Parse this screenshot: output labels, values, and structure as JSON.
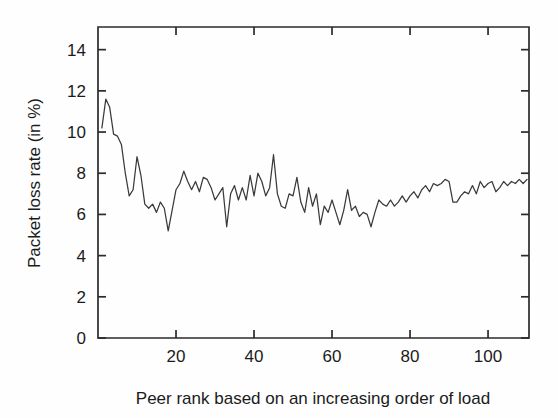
{
  "chart_data": {
    "type": "line",
    "title": "",
    "subtitle": "",
    "xlabel": "Peer rank based on an increasing order of load",
    "ylabel": "Packet loss rate (in %)",
    "xlim": [
      0,
      110.5
    ],
    "ylim": [
      0,
      15.1
    ],
    "xticks": [
      20,
      40,
      60,
      80,
      100
    ],
    "xtick_labels": [
      "20",
      "40",
      "60",
      "80",
      "100"
    ],
    "yticks": [
      0,
      2,
      4,
      6,
      8,
      10,
      12,
      14
    ],
    "ytick_labels": [
      "0",
      "2",
      "4",
      "6",
      "8",
      "10",
      "12",
      "14"
    ],
    "grid": false,
    "legend": null,
    "legend_position": "none",
    "line_color": "#3a3a3a",
    "frame_color": "#2b2b2b",
    "background_color": "#fefefe",
    "series": [
      {
        "name": "Packet loss rate",
        "x": [
          1,
          2,
          3,
          4,
          5,
          6,
          7,
          8,
          9,
          10,
          11,
          12,
          13,
          14,
          15,
          16,
          17,
          18,
          19,
          20,
          21,
          22,
          23,
          24,
          25,
          26,
          27,
          28,
          29,
          30,
          31,
          32,
          33,
          34,
          35,
          36,
          37,
          38,
          39,
          40,
          41,
          42,
          43,
          44,
          45,
          46,
          47,
          48,
          49,
          50,
          51,
          52,
          53,
          54,
          55,
          56,
          57,
          58,
          59,
          60,
          61,
          62,
          63,
          64,
          65,
          66,
          67,
          68,
          69,
          70,
          71,
          72,
          73,
          74,
          75,
          76,
          77,
          78,
          79,
          80,
          81,
          82,
          83,
          84,
          85,
          86,
          87,
          88,
          89,
          90,
          91,
          92,
          93,
          94,
          95,
          96,
          97,
          98,
          99,
          100,
          101,
          102,
          103,
          104,
          105,
          106,
          107,
          108,
          109,
          110
        ],
        "values": [
          10.2,
          11.6,
          11.2,
          9.9,
          9.8,
          9.4,
          8.0,
          6.9,
          7.2,
          8.8,
          7.9,
          6.5,
          6.3,
          6.5,
          6.1,
          6.6,
          6.3,
          5.2,
          6.2,
          7.2,
          7.5,
          8.1,
          7.6,
          7.2,
          7.6,
          7.1,
          7.8,
          7.7,
          7.3,
          6.7,
          7.0,
          7.3,
          5.4,
          7.0,
          7.4,
          6.7,
          7.3,
          6.7,
          7.9,
          6.9,
          8.0,
          7.6,
          6.9,
          7.3,
          8.9,
          7.0,
          6.4,
          6.3,
          7.0,
          6.9,
          7.8,
          6.6,
          6.1,
          7.3,
          6.4,
          7.0,
          5.5,
          6.4,
          6.1,
          6.7,
          6.1,
          5.5,
          6.2,
          7.2,
          6.2,
          6.4,
          5.9,
          6.1,
          6.0,
          5.4,
          6.1,
          6.7,
          6.5,
          6.4,
          6.7,
          6.4,
          6.6,
          6.9,
          6.6,
          6.9,
          7.1,
          6.8,
          7.2,
          7.4,
          7.1,
          7.5,
          7.4,
          7.5,
          7.7,
          7.6,
          6.6,
          6.6,
          6.9,
          7.1,
          7.0,
          7.4,
          7.0,
          7.6,
          7.3,
          7.5,
          7.6,
          7.1,
          7.3,
          7.6,
          7.4,
          7.6,
          7.5,
          7.7,
          7.5,
          7.7
        ]
      }
    ]
  }
}
